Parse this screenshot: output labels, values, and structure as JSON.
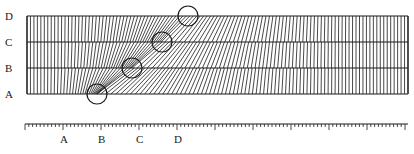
{
  "diagram": {
    "row_labels": [
      "D",
      "C",
      "B",
      "A"
    ],
    "ruler_labels": [
      "A",
      "B",
      "C",
      "D"
    ],
    "colors": {
      "ink": "#1a1a1a",
      "background": "#ffffff"
    },
    "frame": {
      "x1": 27,
      "x2": 408,
      "rows_y": [
        16,
        42,
        68,
        94
      ]
    },
    "circles": [
      {
        "label": "A",
        "cx": 97,
        "cy": 94,
        "r": 10
      },
      {
        "label": "B",
        "cx": 132,
        "cy": 68,
        "r": 10
      },
      {
        "label": "C",
        "cx": 162,
        "cy": 42,
        "r": 10
      },
      {
        "label": "D",
        "cx": 188,
        "cy": 16,
        "r": 10
      }
    ],
    "ruler": {
      "y": 124,
      "x1": 25,
      "x2": 408,
      "minor_step": 3.8,
      "major_every": 10,
      "label_x": [
        64,
        102,
        140,
        178
      ]
    }
  }
}
